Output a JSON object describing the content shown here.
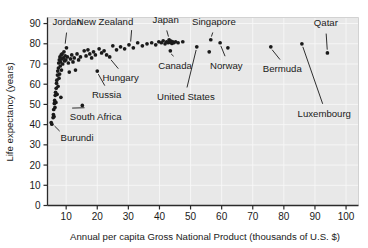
{
  "chart_data": {
    "type": "scatter",
    "title": "",
    "xlabel": "Annual per capita Gross National Product (thousands of U.S. $)",
    "ylabel": "Life expectancy (years)",
    "xlim": [
      4,
      104
    ],
    "ylim": [
      0,
      93
    ],
    "xticks": [
      10,
      20,
      30,
      40,
      50,
      60,
      70,
      80,
      90,
      100
    ],
    "xtick_labels": [
      "10",
      "20",
      "30",
      "40",
      "50",
      "60",
      "70",
      "80",
      "90",
      "100"
    ],
    "yticks": [
      0,
      10,
      20,
      30,
      40,
      50,
      60,
      70,
      80,
      90
    ],
    "ytick_labels": [
      "0",
      "10",
      "20",
      "30",
      "40",
      "50",
      "60",
      "70",
      "80",
      "90"
    ],
    "grid": true,
    "legend": "none",
    "marker": "filled-circle",
    "marker_color": "#1a1a1a",
    "points": [
      [
        5.2,
        41.0
      ],
      [
        5.4,
        40.2
      ],
      [
        5.8,
        43.5
      ],
      [
        5.9,
        45.0
      ],
      [
        6.0,
        47.5
      ],
      [
        6.1,
        44.0
      ],
      [
        6.2,
        50.5
      ],
      [
        6.3,
        52.0
      ],
      [
        6.4,
        48.5
      ],
      [
        6.5,
        54.5
      ],
      [
        6.6,
        56.0
      ],
      [
        6.7,
        51.0
      ],
      [
        6.8,
        58.0
      ],
      [
        6.9,
        60.5
      ],
      [
        7.0,
        62.0
      ],
      [
        7.1,
        55.0
      ],
      [
        7.2,
        64.5
      ],
      [
        7.3,
        66.5
      ],
      [
        7.4,
        59.0
      ],
      [
        7.5,
        68.0
      ],
      [
        7.6,
        70.5
      ],
      [
        7.7,
        63.0
      ],
      [
        7.8,
        72.0
      ],
      [
        7.9,
        65.0
      ],
      [
        8.0,
        73.5
      ],
      [
        8.1,
        69.0
      ],
      [
        8.2,
        71.0
      ],
      [
        8.3,
        53.5
      ],
      [
        8.4,
        74.5
      ],
      [
        8.5,
        67.0
      ],
      [
        8.6,
        72.5
      ],
      [
        8.7,
        75.0
      ],
      [
        8.9,
        70.0
      ],
      [
        9.1,
        73.0
      ],
      [
        9.3,
        76.0
      ],
      [
        9.5,
        71.5
      ],
      [
        9.7,
        74.0
      ],
      [
        9.9,
        72.0
      ],
      [
        10.1,
        78.0
      ],
      [
        10.4,
        73.5
      ],
      [
        10.7,
        70.5
      ],
      [
        11.0,
        66.0
      ],
      [
        11.4,
        72.5
      ],
      [
        11.8,
        74.5
      ],
      [
        12.2,
        71.0
      ],
      [
        12.6,
        73.0
      ],
      [
        13.0,
        67.0
      ],
      [
        13.5,
        75.0
      ],
      [
        14.0,
        72.0
      ],
      [
        14.6,
        73.5
      ],
      [
        15.2,
        49.5
      ],
      [
        15.8,
        76.5
      ],
      [
        16.4,
        74.0
      ],
      [
        17.0,
        77.0
      ],
      [
        17.6,
        75.0
      ],
      [
        18.2,
        73.0
      ],
      [
        18.8,
        76.0
      ],
      [
        19.4,
        74.5
      ],
      [
        20.0,
        66.5
      ],
      [
        20.6,
        77.5
      ],
      [
        21.4,
        75.5
      ],
      [
        22.2,
        76.5
      ],
      [
        23.0,
        74.5
      ],
      [
        24.0,
        73.5
      ],
      [
        25.0,
        79.0
      ],
      [
        26.2,
        77.0
      ],
      [
        27.5,
        78.5
      ],
      [
        28.8,
        77.5
      ],
      [
        30.2,
        79.5
      ],
      [
        31.6,
        78.0
      ],
      [
        33.0,
        80.5
      ],
      [
        34.5,
        79.0
      ],
      [
        36.0,
        80.0
      ],
      [
        37.5,
        80.5
      ],
      [
        38.8,
        79.5
      ],
      [
        39.8,
        81.0
      ],
      [
        40.6,
        80.5
      ],
      [
        41.2,
        81.5
      ],
      [
        41.8,
        80.0
      ],
      [
        42.3,
        81.0
      ],
      [
        42.8,
        80.5
      ],
      [
        43.1,
        82.0
      ],
      [
        43.4,
        80.8
      ],
      [
        43.7,
        81.3
      ],
      [
        44.0,
        80.2
      ],
      [
        44.3,
        81.0
      ],
      [
        44.6,
        80.5
      ],
      [
        43.5,
        76.5
      ],
      [
        45.2,
        81.0
      ],
      [
        46.0,
        80.5
      ],
      [
        47.5,
        81.0
      ],
      [
        52.0,
        78.5
      ],
      [
        56.0,
        76.0
      ],
      [
        56.5,
        82.0
      ],
      [
        59.5,
        80.5
      ],
      [
        62.0,
        78.0
      ],
      [
        75.8,
        78.5
      ],
      [
        85.8,
        80.0
      ],
      [
        94.0,
        75.5
      ]
    ],
    "annotations": [
      {
        "label": "Jordan",
        "label_x": 10.3,
        "label_y": 89.5,
        "point_x": 9.6,
        "point_y": 78.5
      },
      {
        "label": "New Zealand",
        "label_x": 22.5,
        "label_y": 89.5,
        "point_x": 31.6,
        "point_y": 80.2
      },
      {
        "label": "Japan",
        "label_x": 42.0,
        "label_y": 90.5,
        "point_x": 43.1,
        "point_y": 82.0
      },
      {
        "label": "Singapore",
        "label_x": 57.5,
        "label_y": 89.5,
        "point_x": 56.5,
        "point_y": 82.0
      },
      {
        "label": "Qatar",
        "label_x": 93.5,
        "label_y": 89.0,
        "point_x": 94.0,
        "point_y": 75.5
      },
      {
        "label": "Canada",
        "label_x": 45.0,
        "label_y": 67.5,
        "point_x": 43.5,
        "point_y": 76.5
      },
      {
        "label": "Norway",
        "label_x": 61.5,
        "label_y": 67.5,
        "point_x": 59.5,
        "point_y": 80.5
      },
      {
        "label": "Bermuda",
        "label_x": 79.5,
        "label_y": 66.0,
        "point_x": 75.8,
        "point_y": 78.5
      },
      {
        "label": "Luxembourg",
        "label_x": 93.0,
        "label_y": 44.0,
        "point_x": 85.8,
        "point_y": 80.0
      },
      {
        "label": "United States",
        "label_x": 48.5,
        "label_y": 52.0,
        "point_x": 52.0,
        "point_y": 78.5
      },
      {
        "label": "Hungary",
        "label_x": 27.5,
        "label_y": 61.5,
        "point_x": 24.0,
        "point_y": 73.5
      },
      {
        "label": "Russia",
        "label_x": 23.0,
        "label_y": 53.0,
        "point_x": 20.0,
        "point_y": 66.5
      },
      {
        "label": "South Africa",
        "label_x": 19.5,
        "label_y": 42.5,
        "point_x": 15.2,
        "point_y": 49.5
      },
      {
        "label": "Burundi",
        "label_x": 13.5,
        "label_y": 32.0,
        "point_x": 5.4,
        "point_y": 40.2
      }
    ]
  }
}
